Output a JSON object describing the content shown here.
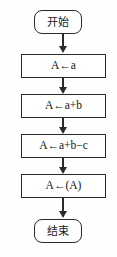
{
  "diagram": {
    "type": "flowchart",
    "orientation": "vertical",
    "stroke_color": "#2b2b2b",
    "background_color": "#fefefe",
    "nodes": [
      {
        "id": "start",
        "shape": "terminator",
        "text": "开始"
      },
      {
        "id": "step1",
        "shape": "process",
        "text": "A←a"
      },
      {
        "id": "step2",
        "shape": "process",
        "text": "A←a+b"
      },
      {
        "id": "step3",
        "shape": "process",
        "text": "A←a+b−c"
      },
      {
        "id": "step4",
        "shape": "process",
        "text": "A←(A)"
      },
      {
        "id": "end",
        "shape": "terminator",
        "text": "结束"
      }
    ],
    "edges": [
      {
        "from": "start",
        "to": "step1"
      },
      {
        "from": "step1",
        "to": "step2"
      },
      {
        "from": "step2",
        "to": "step3"
      },
      {
        "from": "step3",
        "to": "step4"
      },
      {
        "from": "step4",
        "to": "end"
      }
    ]
  },
  "caption": {
    "partial_text": ""
  }
}
